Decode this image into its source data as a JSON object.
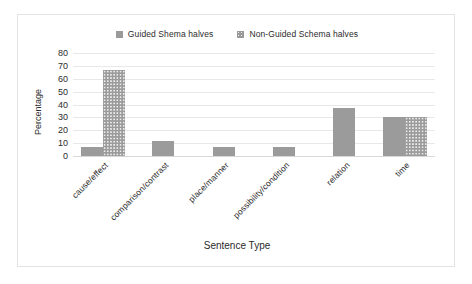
{
  "chart_data": {
    "type": "bar",
    "title": "",
    "xlabel": "Sentence Type",
    "ylabel": "Percentage",
    "ylim": [
      0,
      80
    ],
    "yticks": [
      80,
      70,
      60,
      50,
      40,
      30,
      20,
      10,
      0
    ],
    "grid": true,
    "legend_position": "top-center",
    "categories": [
      "cause/effect",
      "comparison/contrast",
      "place/manner",
      "possibility/condition",
      "relation",
      "time"
    ],
    "series": [
      {
        "name": "Guided Shema halves",
        "color": "#9b9b9b",
        "pattern": "solid",
        "values": [
          7,
          12,
          7,
          7,
          37,
          30
        ]
      },
      {
        "name": "Non-Guided Schema halves",
        "color": "#9b9b9b",
        "pattern": "dotted",
        "values": [
          67,
          0,
          0,
          0,
          0,
          30
        ]
      }
    ]
  },
  "legend": {
    "entries": [
      {
        "label": "Guided Shema halves",
        "swatch": "solid-square-icon"
      },
      {
        "label": "Non-Guided Schema halves",
        "swatch": "dotted-square-icon"
      }
    ]
  },
  "axes": {
    "y_title": "Percentage",
    "x_title": "Sentence Type"
  }
}
